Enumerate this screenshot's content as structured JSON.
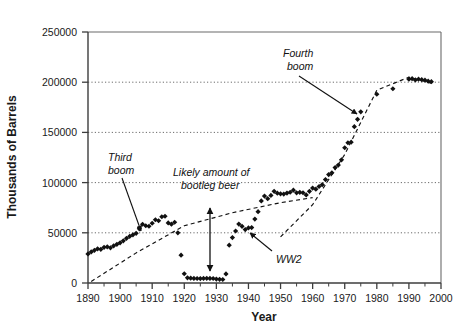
{
  "chart_data": {
    "type": "scatter",
    "title": "",
    "xlabel": "Year",
    "ylabel": "Thousands of Barrels",
    "xlim": [
      1890,
      2000
    ],
    "ylim": [
      0,
      250000
    ],
    "grid": true,
    "legend": "none",
    "x_ticks": [
      1890,
      1900,
      1910,
      1920,
      1930,
      1940,
      1950,
      1960,
      1970,
      1980,
      1990,
      2000
    ],
    "x_tick_labels": [
      "1890",
      "1900",
      "1910",
      "1920",
      "1930",
      "1940",
      "1950",
      "1960",
      "1970",
      "1980",
      "1990",
      "2000"
    ],
    "x_minor_ticks": [
      1895,
      1905,
      1915,
      1925,
      1935,
      1945,
      1955,
      1965,
      1975,
      1985,
      1995
    ],
    "y_ticks": [
      0,
      50000,
      100000,
      150000,
      200000,
      250000
    ],
    "y_tick_labels": [
      "0",
      "50000",
      "100000",
      "150000",
      "200000",
      "250000"
    ],
    "series": [
      {
        "name": "US beer production",
        "marker": "filled-diamond",
        "color": "#111111",
        "x": [
          1890,
          1891,
          1892,
          1893,
          1894,
          1895,
          1896,
          1897,
          1898,
          1899,
          1900,
          1901,
          1902,
          1903,
          1904,
          1905,
          1906,
          1907,
          1908,
          1909,
          1910,
          1911,
          1912,
          1913,
          1914,
          1915,
          1916,
          1917,
          1918,
          1919,
          1920,
          1921,
          1922,
          1923,
          1924,
          1925,
          1926,
          1927,
          1928,
          1929,
          1930,
          1931,
          1932,
          1933,
          1934,
          1935,
          1936,
          1937,
          1938,
          1939,
          1940,
          1941,
          1942,
          1943,
          1944,
          1945,
          1946,
          1947,
          1948,
          1949,
          1950,
          1951,
          1952,
          1953,
          1954,
          1955,
          1956,
          1957,
          1958,
          1959,
          1960,
          1961,
          1962,
          1963,
          1964,
          1965,
          1966,
          1967,
          1968,
          1969,
          1970,
          1971,
          1972,
          1973,
          1974,
          1975,
          1980,
          1985,
          1990,
          1991,
          1992,
          1993,
          1994,
          1995,
          1996,
          1997
        ],
        "y": [
          29000,
          31000,
          32500,
          34000,
          33500,
          35500,
          36000,
          35000,
          37000,
          38500,
          40000,
          42000,
          44500,
          46500,
          48000,
          49500,
          54000,
          58500,
          57000,
          56500,
          59500,
          63000,
          62000,
          66000,
          66500,
          59800,
          58600,
          60500,
          50000,
          27700,
          9200,
          5200,
          4800,
          4600,
          4500,
          4400,
          4600,
          4700,
          4600,
          4500,
          3900,
          3700,
          3500,
          9000,
          37700,
          45200,
          51800,
          58700,
          56400,
          53200,
          54900,
          55200,
          63700,
          71000,
          81700,
          86600,
          84000,
          87200,
          91300,
          89500,
          88800,
          88600,
          89600,
          90400,
          92500,
          89800,
          90300,
          89900,
          87700,
          91300,
          94500,
          93500,
          96100,
          97900,
          103000,
          108000,
          109700,
          115000,
          117500,
          122700,
          134700,
          139700,
          140300,
          155700,
          163000,
          170500,
          188000,
          193500,
          203000,
          203500,
          202300,
          203000,
          202500,
          202000,
          201000,
          200500
        ]
      }
    ],
    "trend_lines": [
      {
        "name": "likely-amount-of-bootleg-beer",
        "style": "dashed",
        "x": [
          1891,
          1905,
          1920,
          1935,
          1950,
          1960
        ],
        "y": [
          1500,
          30000,
          57000,
          70000,
          80000,
          85000
        ]
      },
      {
        "name": "fourth-boom-growth-trend",
        "style": "dashed",
        "x": [
          1950,
          1960,
          1970,
          1980,
          1990,
          1997
        ],
        "y": [
          46000,
          78000,
          128000,
          192000,
          205000,
          199000
        ]
      }
    ],
    "annotations": [
      {
        "id": "third-boom",
        "text_lines": [
          "Third",
          "boom"
        ],
        "points_to_year": 1904,
        "points_to_value": 47000
      },
      {
        "id": "likely-amount-of-bootleg-beer",
        "text_lines": [
          "Likely amount of",
          "bootleg beer"
        ],
        "points_to_year": null,
        "points_to_value": null
      },
      {
        "id": "fourth-boom",
        "text_lines": [
          "Fourth",
          "boom"
        ],
        "points_to_year": 1973,
        "points_to_value": 152000
      },
      {
        "id": "ww2",
        "text_lines": [
          "WW2"
        ],
        "points_to_year": 1945,
        "points_to_value": 83000
      },
      {
        "id": "bootleg-gap-arrow",
        "text_lines": [],
        "points_to_year": 1928,
        "points_to_value": null
      }
    ]
  }
}
